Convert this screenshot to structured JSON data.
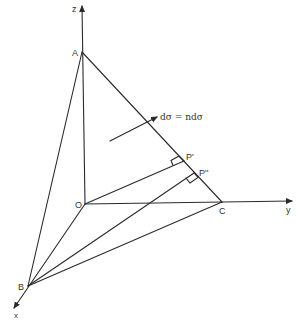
{
  "diagram": {
    "type": "3d-tetrahedron-coordinate-sketch",
    "stroke_color": "#2a2a2a",
    "label_color": "#333333",
    "axes": {
      "z": {
        "label": "z"
      },
      "y": {
        "label": "y"
      },
      "x": {
        "label": "x"
      }
    },
    "points": {
      "origin": {
        "label": "O"
      },
      "A": {
        "label": "A"
      },
      "B": {
        "label": "B"
      },
      "C": {
        "label": "C"
      },
      "P1": {
        "label": "P'"
      },
      "P2": {
        "label": "P''"
      }
    },
    "annotation": {
      "equation": "dσ = ndσ"
    }
  }
}
